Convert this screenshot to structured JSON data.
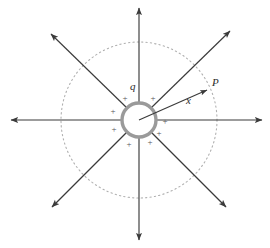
{
  "figure": {
    "canvas": {
      "width": 270,
      "height": 248,
      "background": "#ffffff"
    },
    "center": {
      "x": 139,
      "y": 120
    },
    "colors": {
      "field_line": "#3a3a3a",
      "sphere_ring": "#9a9a9a",
      "sphere_fill": "#ffffff",
      "dotted_circle": "#b0b0b0",
      "plus_sign": "#555555",
      "label": "#2b2b2b"
    },
    "sphere": {
      "name": "charged-sphere",
      "radius": 17,
      "ring_thickness": 3.5,
      "charge_symbol_count": 8,
      "charge_symbol": "+"
    },
    "gaussian_surface": {
      "name": "gaussian-dotted-circle",
      "radius": 78,
      "style": "dotted"
    },
    "labels": {
      "charge": "q",
      "point": "P",
      "distance": "x"
    },
    "label_positions": {
      "charge": {
        "x": 130,
        "y": 90
      },
      "point": {
        "x": 212,
        "y": 86
      },
      "distance": {
        "x": 186,
        "y": 104
      }
    },
    "radius_vector": {
      "name": "radius-arrow",
      "from": {
        "x": 139,
        "y": 120
      },
      "to": {
        "x": 207,
        "y": 90
      },
      "label": "x"
    },
    "field_lines": [
      {
        "name": "field-line-right",
        "angle_deg": 0,
        "length": 123
      },
      {
        "name": "field-line-upper-right",
        "angle_deg": 45,
        "length": 113
      },
      {
        "name": "field-line-up",
        "angle_deg": 90,
        "length": 118
      },
      {
        "name": "field-line-upper-left",
        "angle_deg": 135,
        "length": 113
      },
      {
        "name": "field-line-left",
        "angle_deg": 180,
        "length": 129
      },
      {
        "name": "field-line-lower-left",
        "angle_deg": 225,
        "length": 113
      },
      {
        "name": "field-line-down",
        "angle_deg": 270,
        "length": 120
      },
      {
        "name": "field-line-lower-right",
        "angle_deg": 315,
        "length": 113
      }
    ],
    "charge_signs": [
      {
        "name": "plus-sign-1",
        "x": 125,
        "y": 101
      },
      {
        "name": "plus-sign-2",
        "x": 153,
        "y": 101
      },
      {
        "name": "plus-sign-3",
        "x": 113,
        "y": 114
      },
      {
        "name": "plus-sign-4",
        "x": 165,
        "y": 124
      },
      {
        "name": "plus-sign-5",
        "x": 114,
        "y": 132
      },
      {
        "name": "plus-sign-6",
        "x": 159,
        "y": 136
      },
      {
        "name": "plus-sign-7",
        "x": 129,
        "y": 147
      },
      {
        "name": "plus-sign-8",
        "x": 150,
        "y": 145
      }
    ]
  }
}
